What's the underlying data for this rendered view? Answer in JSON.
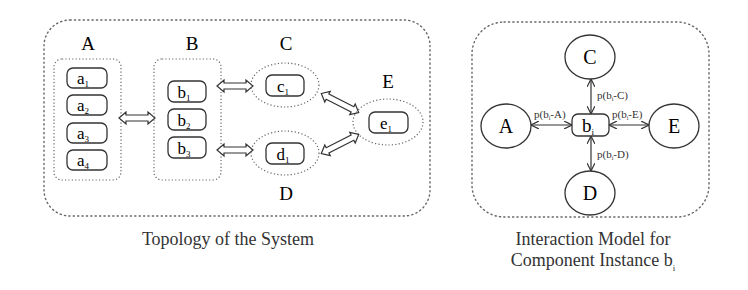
{
  "left_panel": {
    "caption": "Topology of the System",
    "groups": [
      {
        "label": "A",
        "items": [
          "a",
          "a",
          "a",
          "a"
        ],
        "subs": [
          "1",
          "2",
          "3",
          "4"
        ]
      },
      {
        "label": "B",
        "items": [
          "b",
          "b",
          "b"
        ],
        "subs": [
          "1",
          "2",
          "3"
        ]
      },
      {
        "label": "C",
        "items": [
          "c"
        ],
        "subs": [
          "1"
        ]
      },
      {
        "label": "D",
        "items": [
          "d"
        ],
        "subs": [
          "1"
        ]
      },
      {
        "label": "E",
        "items": [
          "e"
        ],
        "subs": [
          "1"
        ]
      }
    ]
  },
  "right_panel": {
    "caption_line1": "Interaction Model for",
    "caption_line2": "Component Instance b",
    "caption_sub": "i",
    "center": {
      "text": "b",
      "sub": "i"
    },
    "nodes": [
      "A",
      "C",
      "D",
      "E"
    ],
    "edge_labels": {
      "A": {
        "pre": "p(b",
        "sub": "i",
        "post": "-A)"
      },
      "C": {
        "pre": "p(b",
        "sub": "i",
        "post": "-C)"
      },
      "D": {
        "pre": "p(b",
        "sub": "i",
        "post": "-D)"
      },
      "E": {
        "pre": "p(b",
        "sub": "i",
        "post": "-E)"
      }
    }
  },
  "colors": {
    "stroke": "#333333",
    "dotted": "#666666"
  }
}
